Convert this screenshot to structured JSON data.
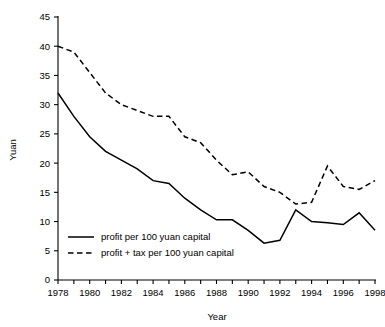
{
  "chart_data": {
    "type": "line",
    "title": "",
    "xlabel": "Year",
    "ylabel": "Yuan",
    "xlim": [
      1978,
      1998
    ],
    "ylim": [
      0,
      45
    ],
    "grid": false,
    "legend_position": "inside-bottom-left",
    "x": [
      1978,
      1979,
      1980,
      1981,
      1982,
      1983,
      1984,
      1985,
      1986,
      1987,
      1988,
      1989,
      1990,
      1991,
      1992,
      1993,
      1994,
      1995,
      1996,
      1997,
      1998
    ],
    "x_tick_labels": [
      "1978",
      "",
      "1980",
      "",
      "1982",
      "",
      "1984",
      "",
      "1986",
      "",
      "1988",
      "",
      "1990",
      "",
      "1992",
      "",
      "1994",
      "",
      "1996",
      "",
      "1998"
    ],
    "y_ticks": [
      0,
      5,
      10,
      15,
      20,
      25,
      30,
      35,
      40,
      45
    ],
    "y_tick_labels": [
      "0",
      "5",
      "10",
      "15",
      "20",
      "25",
      "30",
      "35",
      "40",
      "45"
    ],
    "series": [
      {
        "name": "profit per 100 yuan capital",
        "style": "solid",
        "color": "#000000",
        "values": [
          32.0,
          28.0,
          24.5,
          22.0,
          20.5,
          19.0,
          17.0,
          16.5,
          14.0,
          12.0,
          10.3,
          10.3,
          8.5,
          6.3,
          6.8,
          12.0,
          10.0,
          9.8,
          9.5,
          11.5,
          8.5
        ]
      },
      {
        "name": "profit + tax per 100 yuan capital",
        "style": "dashed",
        "color": "#000000",
        "values": [
          40.0,
          39.0,
          35.5,
          32.0,
          30.0,
          29.0,
          28.0,
          28.0,
          24.5,
          23.5,
          20.5,
          18.0,
          18.5,
          16.0,
          15.0,
          13.0,
          13.3,
          19.5,
          16.0,
          15.5,
          17.0
        ]
      }
    ]
  },
  "legend": {
    "items": [
      {
        "label": "profit per 100 yuan capital",
        "style": "solid"
      },
      {
        "label": "profit + tax per 100 yuan capital",
        "style": "dashed"
      }
    ]
  }
}
